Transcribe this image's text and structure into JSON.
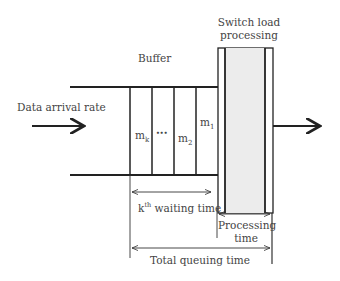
{
  "diagram": {
    "buffer_label": "Buffer",
    "switch_label_line1": "Switch load",
    "switch_label_line2": "processing",
    "input_label": "Data arrival rate",
    "cells": [
      {
        "label": "m",
        "sub": "k"
      },
      {
        "label": "•••",
        "sub": ""
      },
      {
        "label": "m",
        "sub": "2"
      },
      {
        "label": "m",
        "sub": "1"
      }
    ],
    "kth_label": "k",
    "kth_sup": "th",
    "kth_rest": " waiting time",
    "processing_line1": "Processing",
    "processing_line2": "time",
    "total_label": "Total queuing time",
    "colors": {
      "line": "#222222",
      "switch_fill": "#ececec"
    }
  }
}
